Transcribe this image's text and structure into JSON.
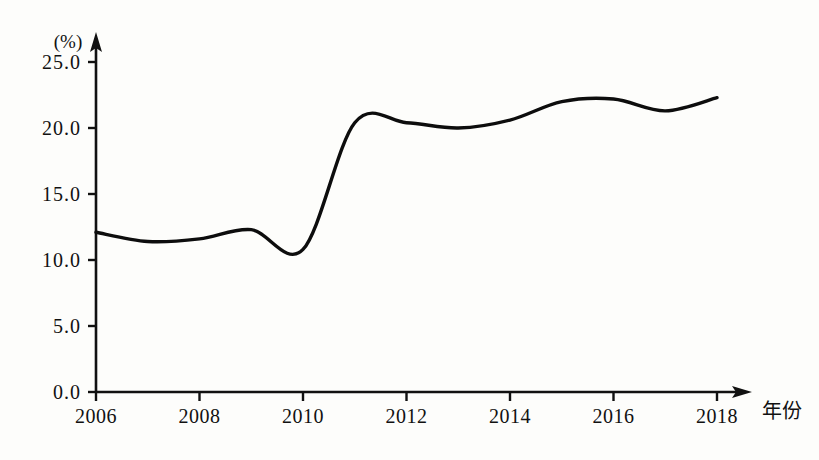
{
  "chart_data": {
    "type": "line",
    "title": "",
    "subtitle": "",
    "xlabel": "年份",
    "ylabel": "",
    "unit_label": "(%)",
    "x": [
      2006,
      2007,
      2008,
      2009,
      2010,
      2011,
      2012,
      2013,
      2014,
      2015,
      2016,
      2017,
      2018
    ],
    "values": [
      12.1,
      11.4,
      11.6,
      12.3,
      10.8,
      20.4,
      20.4,
      20.0,
      20.6,
      22.0,
      22.2,
      21.3,
      22.3
    ],
    "series": [
      {
        "name": "",
        "values": [
          12.1,
          11.4,
          11.6,
          12.3,
          10.8,
          20.4,
          20.4,
          20.0,
          20.6,
          22.0,
          22.2,
          21.3,
          22.3
        ]
      }
    ],
    "xticks": [
      2006,
      2008,
      2010,
      2012,
      2014,
      2016,
      2018
    ],
    "xtick_labels": [
      "2006",
      "2008",
      "2010",
      "2012",
      "2014",
      "2016",
      "2018"
    ],
    "yticks": [
      0.0,
      5.0,
      10.0,
      15.0,
      20.0,
      25.0
    ],
    "ytick_labels": [
      "0.0",
      "5.0",
      "10.0",
      "15.0",
      "20.0",
      "25.0"
    ],
    "xlim": [
      2006,
      2018.1
    ],
    "ylim": [
      0.0,
      25.0
    ],
    "grid": false,
    "legend": false,
    "legend_position": "none",
    "line_color": "#0d0d0d",
    "background_color": "#fdfdfb",
    "axis_color": "#111111",
    "annotations": []
  }
}
